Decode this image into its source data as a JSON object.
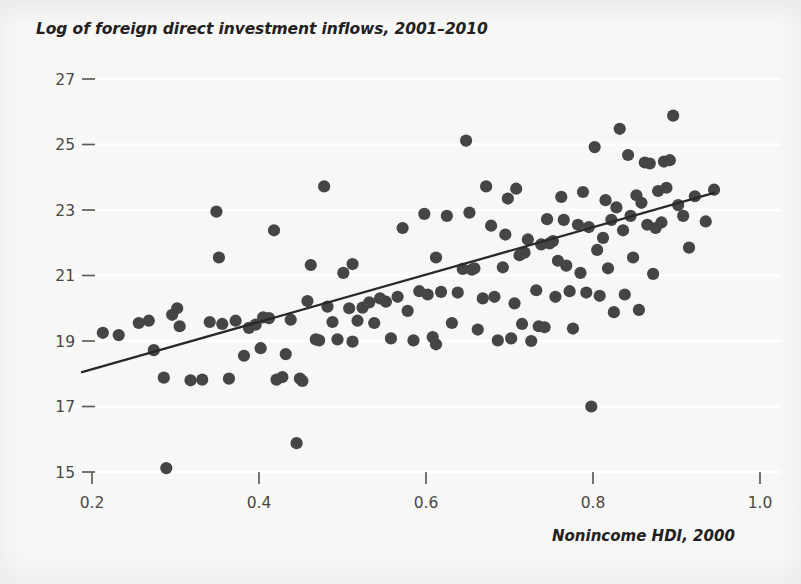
{
  "figure": {
    "background_color": "#f7f7f5",
    "ink_color": "#474543",
    "trendline_color": "#2a2826",
    "gridline_color": "#ffffff"
  },
  "chart_data": {
    "type": "scatter",
    "title": "Log of foreign direct investment inflows, 2001–2010",
    "xlabel": "Nonincome HDI, 2000",
    "ylabel": "Log of foreign direct investment inflows, 2001–2010",
    "xlim": [
      0.175,
      1.02
    ],
    "ylim": [
      14.55,
      27.3
    ],
    "xticks": [
      0.2,
      0.4,
      0.6,
      0.8,
      1.0
    ],
    "xtick_labels": [
      "0.2",
      "0.4",
      "0.6",
      "0.8",
      "1.0"
    ],
    "yticks": [
      15,
      17,
      19,
      21,
      23,
      25,
      27
    ],
    "ytick_labels": [
      "15",
      "17",
      "19",
      "21",
      "23",
      "25",
      "27"
    ],
    "grid": "horizontal-white-lines",
    "legend": "none",
    "trendline": {
      "type": "linear-fit",
      "x_start": 0.188,
      "y_start": 18.05,
      "x_end": 0.945,
      "y_end": 23.52
    },
    "points": [
      [
        0.213,
        19.25
      ],
      [
        0.232,
        19.18
      ],
      [
        0.256,
        19.55
      ],
      [
        0.268,
        19.62
      ],
      [
        0.274,
        18.72
      ],
      [
        0.286,
        17.88
      ],
      [
        0.289,
        15.12
      ],
      [
        0.296,
        19.8
      ],
      [
        0.302,
        20.0
      ],
      [
        0.318,
        17.8
      ],
      [
        0.332,
        17.82
      ],
      [
        0.341,
        19.58
      ],
      [
        0.349,
        22.95
      ],
      [
        0.352,
        21.55
      ],
      [
        0.356,
        19.52
      ],
      [
        0.364,
        17.85
      ],
      [
        0.382,
        18.55
      ],
      [
        0.388,
        19.4
      ],
      [
        0.396,
        19.5
      ],
      [
        0.402,
        18.78
      ],
      [
        0.405,
        19.72
      ],
      [
        0.412,
        19.7
      ],
      [
        0.418,
        22.38
      ],
      [
        0.421,
        17.82
      ],
      [
        0.428,
        17.9
      ],
      [
        0.432,
        18.6
      ],
      [
        0.438,
        19.65
      ],
      [
        0.445,
        15.88
      ],
      [
        0.449,
        17.85
      ],
      [
        0.452,
        17.78
      ],
      [
        0.458,
        20.22
      ],
      [
        0.462,
        21.32
      ],
      [
        0.468,
        19.05
      ],
      [
        0.472,
        19.02
      ],
      [
        0.478,
        23.72
      ],
      [
        0.482,
        20.05
      ],
      [
        0.488,
        19.58
      ],
      [
        0.494,
        19.05
      ],
      [
        0.501,
        21.08
      ],
      [
        0.508,
        20.0
      ],
      [
        0.512,
        21.35
      ],
      [
        0.518,
        19.62
      ],
      [
        0.524,
        20.02
      ],
      [
        0.532,
        20.18
      ],
      [
        0.538,
        19.55
      ],
      [
        0.545,
        20.3
      ],
      [
        0.552,
        20.2
      ],
      [
        0.558,
        19.08
      ],
      [
        0.566,
        20.35
      ],
      [
        0.572,
        22.45
      ],
      [
        0.578,
        19.92
      ],
      [
        0.585,
        19.02
      ],
      [
        0.592,
        20.52
      ],
      [
        0.598,
        22.88
      ],
      [
        0.602,
        20.42
      ],
      [
        0.608,
        19.12
      ],
      [
        0.612,
        21.55
      ],
      [
        0.618,
        20.5
      ],
      [
        0.625,
        22.82
      ],
      [
        0.631,
        19.55
      ],
      [
        0.638,
        20.48
      ],
      [
        0.644,
        21.2
      ],
      [
        0.648,
        25.12
      ],
      [
        0.652,
        22.92
      ],
      [
        0.655,
        21.18
      ],
      [
        0.658,
        21.22
      ],
      [
        0.662,
        19.35
      ],
      [
        0.668,
        20.3
      ],
      [
        0.672,
        23.72
      ],
      [
        0.678,
        22.52
      ],
      [
        0.682,
        20.35
      ],
      [
        0.686,
        19.02
      ],
      [
        0.692,
        21.25
      ],
      [
        0.695,
        22.25
      ],
      [
        0.698,
        23.35
      ],
      [
        0.702,
        19.08
      ],
      [
        0.706,
        20.15
      ],
      [
        0.708,
        23.65
      ],
      [
        0.712,
        21.62
      ],
      [
        0.715,
        19.52
      ],
      [
        0.718,
        21.7
      ],
      [
        0.722,
        22.1
      ],
      [
        0.726,
        19.0
      ],
      [
        0.732,
        20.55
      ],
      [
        0.735,
        19.45
      ],
      [
        0.738,
        21.95
      ],
      [
        0.742,
        19.42
      ],
      [
        0.745,
        22.72
      ],
      [
        0.748,
        21.98
      ],
      [
        0.752,
        22.05
      ],
      [
        0.755,
        20.35
      ],
      [
        0.758,
        21.45
      ],
      [
        0.762,
        23.4
      ],
      [
        0.765,
        22.7
      ],
      [
        0.768,
        21.3
      ],
      [
        0.772,
        20.52
      ],
      [
        0.776,
        19.38
      ],
      [
        0.782,
        22.55
      ],
      [
        0.785,
        21.08
      ],
      [
        0.788,
        23.55
      ],
      [
        0.792,
        20.48
      ],
      [
        0.795,
        22.48
      ],
      [
        0.798,
        17.0
      ],
      [
        0.802,
        24.92
      ],
      [
        0.805,
        21.78
      ],
      [
        0.808,
        20.38
      ],
      [
        0.812,
        22.15
      ],
      [
        0.815,
        23.3
      ],
      [
        0.818,
        21.22
      ],
      [
        0.822,
        22.7
      ],
      [
        0.825,
        19.88
      ],
      [
        0.828,
        23.08
      ],
      [
        0.832,
        25.48
      ],
      [
        0.836,
        22.38
      ],
      [
        0.838,
        20.42
      ],
      [
        0.842,
        24.68
      ],
      [
        0.845,
        22.82
      ],
      [
        0.848,
        21.55
      ],
      [
        0.852,
        23.45
      ],
      [
        0.855,
        19.95
      ],
      [
        0.858,
        23.22
      ],
      [
        0.862,
        24.45
      ],
      [
        0.865,
        22.55
      ],
      [
        0.868,
        24.42
      ],
      [
        0.872,
        21.05
      ],
      [
        0.875,
        22.45
      ],
      [
        0.878,
        23.58
      ],
      [
        0.882,
        22.62
      ],
      [
        0.885,
        24.48
      ],
      [
        0.888,
        23.68
      ],
      [
        0.892,
        24.52
      ],
      [
        0.896,
        25.88
      ],
      [
        0.902,
        23.15
      ],
      [
        0.908,
        22.82
      ],
      [
        0.915,
        21.85
      ],
      [
        0.922,
        23.42
      ],
      [
        0.935,
        22.65
      ],
      [
        0.945,
        23.62
      ],
      [
        0.512,
        18.98
      ],
      [
        0.612,
        18.9
      ],
      [
        0.305,
        19.45
      ],
      [
        0.372,
        19.62
      ]
    ]
  }
}
